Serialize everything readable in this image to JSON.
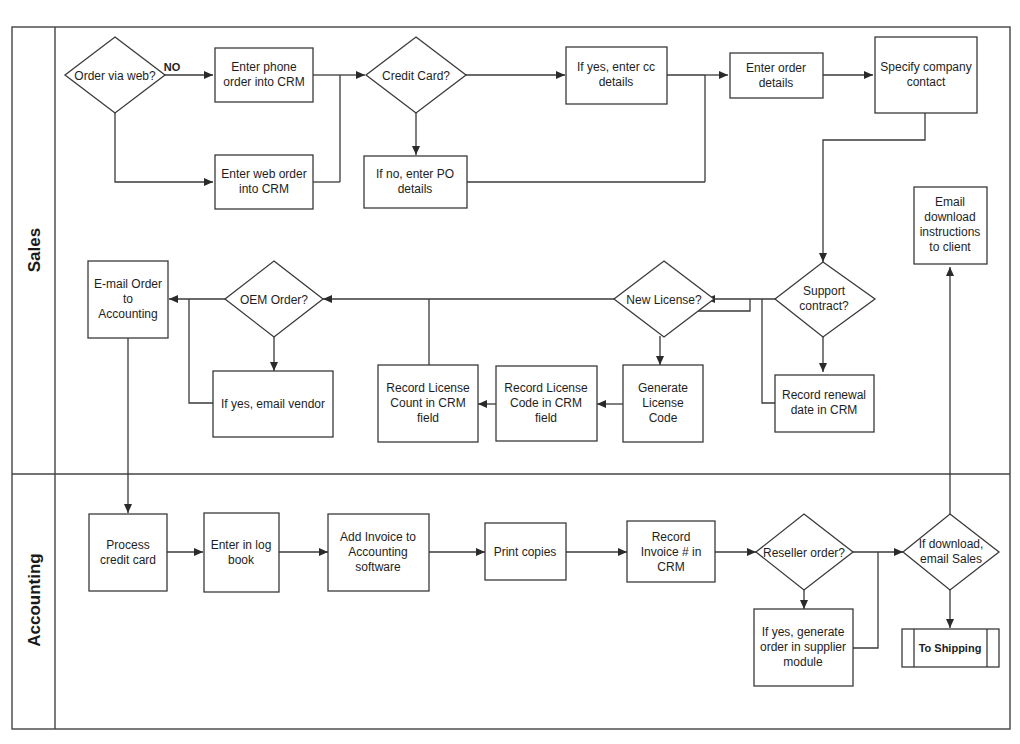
{
  "lanes": [
    {
      "id": "sales",
      "label": "Sales"
    },
    {
      "id": "accounting",
      "label": "Accounting"
    }
  ],
  "nodes": {
    "order_via_web": {
      "type": "decision",
      "lines": [
        "Order via web?"
      ]
    },
    "enter_phone_order": {
      "type": "process",
      "lines": [
        "Enter phone",
        "order into CRM"
      ]
    },
    "enter_web_order": {
      "type": "process",
      "lines": [
        "Enter web order",
        "into CRM"
      ]
    },
    "credit_card": {
      "type": "decision",
      "lines": [
        "Credit Card?"
      ]
    },
    "enter_cc": {
      "type": "process",
      "lines": [
        "If yes, enter cc",
        "details"
      ]
    },
    "enter_po": {
      "type": "process",
      "lines": [
        "If no, enter PO",
        "details"
      ]
    },
    "enter_order_details": {
      "type": "process",
      "lines": [
        "Enter order",
        "details"
      ]
    },
    "specify_contact": {
      "type": "process",
      "lines": [
        "Specify company",
        "contact"
      ]
    },
    "email_download": {
      "type": "process",
      "lines": [
        "Email",
        "download",
        "instructions",
        "to client"
      ]
    },
    "support_contract": {
      "type": "decision",
      "lines": [
        "Support",
        "contract?"
      ]
    },
    "record_renewal": {
      "type": "process",
      "lines": [
        "Record renewal",
        "date in CRM"
      ]
    },
    "new_license": {
      "type": "decision",
      "lines": [
        "New License?"
      ]
    },
    "generate_license": {
      "type": "process",
      "lines": [
        "Generate",
        "License",
        "Code"
      ]
    },
    "record_license_code": {
      "type": "process",
      "lines": [
        "Record License",
        "Code in CRM",
        "field"
      ]
    },
    "record_license_count": {
      "type": "process",
      "lines": [
        "Record License",
        "Count in CRM",
        "field"
      ]
    },
    "oem_order": {
      "type": "decision",
      "lines": [
        "OEM Order?"
      ]
    },
    "email_vendor": {
      "type": "process",
      "lines": [
        "If yes, email vendor"
      ]
    },
    "email_accounting": {
      "type": "process",
      "lines": [
        "E-mail Order",
        "to",
        "Accounting"
      ]
    },
    "process_cc": {
      "type": "process",
      "lines": [
        "Process",
        "credit card"
      ]
    },
    "enter_log_book": {
      "type": "process",
      "lines": [
        "Enter in log",
        "book"
      ]
    },
    "add_invoice": {
      "type": "process",
      "lines": [
        "Add Invoice to",
        "Accounting",
        "software"
      ]
    },
    "print_copies": {
      "type": "process",
      "lines": [
        "Print copies"
      ]
    },
    "record_invoice": {
      "type": "process",
      "lines": [
        "Record",
        "Invoice # in",
        "CRM"
      ]
    },
    "reseller_order": {
      "type": "decision",
      "lines": [
        "Reseller order?"
      ]
    },
    "supplier_order": {
      "type": "process",
      "lines": [
        "If yes, generate",
        "order in supplier",
        "module"
      ]
    },
    "if_download": {
      "type": "decision",
      "lines": [
        "If download,",
        "email Sales"
      ]
    },
    "to_shipping": {
      "type": "predefined",
      "lines": [
        "To Shipping"
      ]
    }
  },
  "edge_labels": {
    "no": "NO"
  }
}
